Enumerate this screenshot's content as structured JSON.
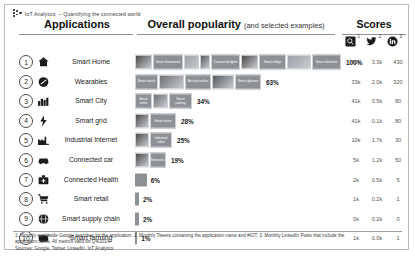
{
  "brand": {
    "name": "IoT Analytics",
    "tagline": "– Quantifying the connected world",
    "logo_icon": "dots-logo-icon"
  },
  "headers": {
    "applications": "Applications",
    "popularity": "Overall popularity",
    "popularity_sub": "(and selected examples)",
    "scores": "Scores"
  },
  "score_columns": [
    {
      "icon": "google-search-icon",
      "sup": "1",
      "label": "Monthly worldwide Google searches"
    },
    {
      "icon": "twitter-bird-icon",
      "sup": "2",
      "label": "Monthly Tweets"
    },
    {
      "icon": "linkedin-icon",
      "sup": "3",
      "label": "Monthly LinkedIn Posts"
    }
  ],
  "chart_data": {
    "type": "bar",
    "title": "Overall popularity (and selected examples)",
    "xlabel": "",
    "ylabel": "",
    "xlim": [
      0,
      100
    ],
    "grid": false,
    "legend": "none",
    "unit": "%",
    "categories": [
      "Smart Home",
      "Wearables",
      "Smart City",
      "Smart grid",
      "Industrial internet",
      "Connected car",
      "Connected Health",
      "Smart retail",
      "Smart supply chain",
      "Smart farming"
    ],
    "values": [
      100,
      63,
      34,
      28,
      25,
      19,
      6,
      2,
      2,
      1
    ],
    "value_labels": [
      "100%",
      "63%",
      "34%",
      "28%",
      "25%",
      "19%",
      "6%",
      "2%",
      "2%",
      "1%"
    ],
    "series": [
      {
        "name": "Google searches",
        "values": [
          "61k",
          "33k",
          "41k",
          "41k",
          "10k",
          "5k",
          "2k",
          "1k",
          "0k",
          "1k"
        ]
      },
      {
        "name": "Tweets",
        "values": [
          "3.3k",
          "2.0k",
          "0.5k",
          "0.1k",
          "1.7k",
          "1.2k",
          "0.5k",
          "0.2k",
          "0.2k",
          "0.0k"
        ]
      },
      {
        "name": "LinkedIn Posts",
        "values": [
          "430",
          "320",
          "80",
          "80",
          "30",
          "50",
          "5",
          "1",
          "0",
          "1"
        ]
      }
    ],
    "bar_color": "#8d9196"
  },
  "rows": [
    {
      "rank": "1",
      "name": "Smart Home",
      "icon": "house-icon",
      "pct": "100%",
      "value": 100,
      "scores": [
        "61k",
        "3.3k",
        "430"
      ],
      "examples": [
        {
          "caption": "",
          "kind": "photo",
          "w": 17
        },
        {
          "caption": "Smart thermostat",
          "kind": "label",
          "w": 30
        },
        {
          "caption": "",
          "kind": "photo",
          "w": 15
        },
        {
          "caption": "",
          "kind": "photo",
          "w": 10
        },
        {
          "caption": "Connected lights",
          "kind": "label",
          "w": 29
        },
        {
          "caption": "",
          "kind": "photo",
          "w": 17
        },
        {
          "caption": "Smart fridge",
          "kind": "label",
          "w": 27
        },
        {
          "caption": "",
          "kind": "photo",
          "w": 24
        },
        {
          "caption": "Smart doorlock",
          "kind": "label",
          "w": 29
        }
      ]
    },
    {
      "rank": "2",
      "name": "Wearables",
      "icon": "wearable-icon",
      "pct": "63%",
      "value": 63,
      "scores": [
        "33k",
        "2.0k",
        "320"
      ],
      "examples": [
        {
          "caption": "Smart watch",
          "kind": "label",
          "w": 23
        },
        {
          "caption": "",
          "kind": "photo",
          "w": 25
        },
        {
          "caption": "Activity tracker",
          "kind": "label",
          "w": 26
        },
        {
          "caption": "",
          "kind": "photo",
          "w": 22
        },
        {
          "caption": "Smart glasses",
          "kind": "label",
          "w": 26
        }
      ]
    },
    {
      "rank": "3",
      "name": "Smart City",
      "icon": "city-icon",
      "pct": "34%",
      "value": 34,
      "scores": [
        "41k",
        "0.5k",
        "80"
      ],
      "examples": [
        {
          "caption": "Smart meter",
          "kind": "label",
          "w": 17
        },
        {
          "caption": "",
          "kind": "photo",
          "w": 15
        },
        {
          "caption": "Smart parking",
          "kind": "label",
          "w": 23
        }
      ]
    },
    {
      "rank": "4",
      "name": "Smart grid",
      "icon": "plug-icon",
      "pct": "28%",
      "value": 28,
      "scores": [
        "41k",
        "0.1k",
        "80"
      ],
      "examples": [
        {
          "caption": "",
          "kind": "photo",
          "w": 14
        },
        {
          "caption": "Smart meter",
          "kind": "label",
          "w": 26
        }
      ]
    },
    {
      "rank": "5",
      "name": "Industrial Internet",
      "icon": "factory-icon",
      "pct": "25%",
      "value": 25,
      "scores": [
        "10k",
        "1.7k",
        "30"
      ],
      "examples": [
        {
          "caption": "",
          "kind": "photo",
          "w": 14
        },
        {
          "caption": "Industrial robot",
          "kind": "label",
          "w": 22
        }
      ]
    },
    {
      "rank": "6",
      "name": "Connected car",
      "icon": "car-icon",
      "pct": "19%",
      "value": 19,
      "scores": [
        "5k",
        "1.2k",
        "50"
      ],
      "examples": [
        {
          "caption": "",
          "kind": "photo",
          "w": 14
        },
        {
          "caption": "Telematics",
          "kind": "label",
          "w": 16
        }
      ]
    },
    {
      "rank": "7",
      "name": "Connected Health",
      "icon": "medkit-icon",
      "pct": "6%",
      "value": 6,
      "scores": [
        "2k",
        "0.5k",
        "5"
      ],
      "examples": []
    },
    {
      "rank": "8",
      "name": "Smart retail",
      "icon": "shopping-cart-icon",
      "pct": "2%",
      "value": 2,
      "scores": [
        "1k",
        "0.2k",
        "1"
      ],
      "examples": []
    },
    {
      "rank": "9",
      "name": "Smart supply chain",
      "icon": "globe-truck-icon",
      "pct": "2%",
      "value": 2,
      "scores": [
        "0k",
        "0.2k",
        "0"
      ],
      "examples": []
    },
    {
      "rank": "10",
      "name": "Smart farming",
      "icon": "cow-icon",
      "pct": "1%",
      "value": 1,
      "scores": [
        "1k",
        "0.0k",
        "1"
      ],
      "examples": []
    }
  ],
  "footnotes": {
    "line1": "1. Monthly worldwide Google searches for the application. 2. Monthly Tweets containing the application name and #IOT. 3. Monthly LinkedIn Posts that include the",
    "line2": "application name.  All metrics valid for Q4/2014.",
    "line3": "Sources: Google, Twitter, LinkedIn, IoT Analytics"
  }
}
